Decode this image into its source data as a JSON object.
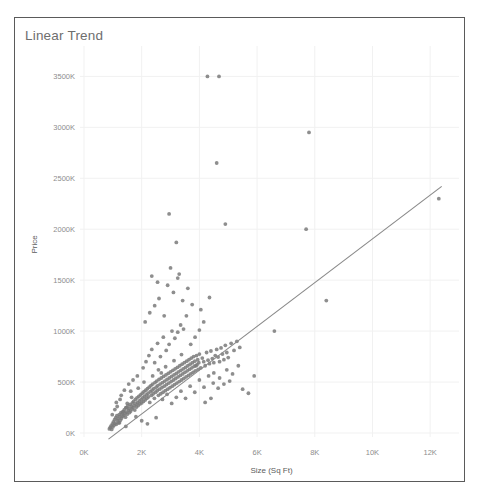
{
  "chart_title": "Linear Trend",
  "chart_data": {
    "type": "scatter",
    "title": "Linear Trend",
    "xlabel": "Size (Sq Ft)",
    "ylabel": "Price",
    "grid": true,
    "legend": false,
    "xlim": [
      0,
      13000
    ],
    "ylim": [
      0,
      3700000
    ],
    "x_ticks": [
      0,
      2000,
      4000,
      6000,
      8000,
      10000,
      12000
    ],
    "x_tick_labels": [
      "0K",
      "2K",
      "4K",
      "6K",
      "8K",
      "10K",
      "12K"
    ],
    "y_ticks": [
      0,
      500000,
      1000000,
      1500000,
      2000000,
      2500000,
      3000000,
      3500000
    ],
    "y_tick_labels": [
      "0K",
      "500K",
      "1000K",
      "1500K",
      "2000K",
      "2500K",
      "3000K",
      "3500K"
    ],
    "point_color": "#7a7a7a",
    "trend_color": "#888888",
    "trendline": {
      "x": [
        850,
        12400
      ],
      "y": [
        -60000,
        2420000
      ]
    },
    "series": [
      {
        "name": "Price vs Size",
        "points": [
          [
            880,
            40000
          ],
          [
            910,
            55000
          ],
          [
            940,
            70000
          ],
          [
            960,
            35000
          ],
          [
            985,
            90000
          ],
          [
            1000,
            60000
          ],
          [
            1020,
            110000
          ],
          [
            1040,
            75000
          ],
          [
            1060,
            130000
          ],
          [
            1080,
            95000
          ],
          [
            1100,
            150000
          ],
          [
            1120,
            85000
          ],
          [
            1140,
            170000
          ],
          [
            1160,
            120000
          ],
          [
            1180,
            140000
          ],
          [
            1200,
            100000
          ],
          [
            1220,
            180000
          ],
          [
            1240,
            160000
          ],
          [
            1260,
            125000
          ],
          [
            1280,
            200000
          ],
          [
            1300,
            145000
          ],
          [
            1320,
            190000
          ],
          [
            1340,
            165000
          ],
          [
            1360,
            210000
          ],
          [
            1380,
            175000
          ],
          [
            1400,
            230000
          ],
          [
            1420,
            195000
          ],
          [
            1440,
            155000
          ],
          [
            1460,
            250000
          ],
          [
            1480,
            205000
          ],
          [
            1500,
            185000
          ],
          [
            1520,
            265000
          ],
          [
            1540,
            225000
          ],
          [
            1560,
            240000
          ],
          [
            1580,
            200000
          ],
          [
            1600,
            280000
          ],
          [
            1620,
            215000
          ],
          [
            1640,
            260000
          ],
          [
            1660,
            235000
          ],
          [
            1680,
            295000
          ],
          [
            1700,
            250000
          ],
          [
            1720,
            310000
          ],
          [
            1740,
            270000
          ],
          [
            1760,
            225000
          ],
          [
            1780,
            330000
          ],
          [
            1800,
            285000
          ],
          [
            1820,
            255000
          ],
          [
            1840,
            345000
          ],
          [
            1860,
            300000
          ],
          [
            1880,
            270000
          ],
          [
            1900,
            360000
          ],
          [
            1920,
            315000
          ],
          [
            1940,
            285000
          ],
          [
            1960,
            375000
          ],
          [
            1980,
            330000
          ],
          [
            2000,
            295000
          ],
          [
            2020,
            390000
          ],
          [
            2040,
            345000
          ],
          [
            2060,
            310000
          ],
          [
            2080,
            405000
          ],
          [
            2100,
            360000
          ],
          [
            2120,
            325000
          ],
          [
            2140,
            420000
          ],
          [
            2160,
            375000
          ],
          [
            2180,
            340000
          ],
          [
            2200,
            435000
          ],
          [
            2220,
            390000
          ],
          [
            2240,
            355000
          ],
          [
            2260,
            450000
          ],
          [
            2280,
            300000
          ],
          [
            2300,
            405000
          ],
          [
            2320,
            465000
          ],
          [
            2340,
            370000
          ],
          [
            2360,
            420000
          ],
          [
            2380,
            480000
          ],
          [
            2400,
            385000
          ],
          [
            2420,
            435000
          ],
          [
            2440,
            340000
          ],
          [
            2460,
            495000
          ],
          [
            2480,
            400000
          ],
          [
            2500,
            450000
          ],
          [
            2520,
            510000
          ],
          [
            2540,
            415000
          ],
          [
            2560,
            465000
          ],
          [
            2580,
            370000
          ],
          [
            2600,
            525000
          ],
          [
            2620,
            430000
          ],
          [
            2640,
            480000
          ],
          [
            2660,
            385000
          ],
          [
            2680,
            540000
          ],
          [
            2700,
            445000
          ],
          [
            2720,
            495000
          ],
          [
            2740,
            400000
          ],
          [
            2760,
            555000
          ],
          [
            2780,
            460000
          ],
          [
            2800,
            510000
          ],
          [
            2820,
            415000
          ],
          [
            2840,
            570000
          ],
          [
            2860,
            475000
          ],
          [
            2880,
            525000
          ],
          [
            2900,
            430000
          ],
          [
            2920,
            585000
          ],
          [
            2940,
            490000
          ],
          [
            2960,
            540000
          ],
          [
            2980,
            445000
          ],
          [
            3000,
            600000
          ],
          [
            3020,
            505000
          ],
          [
            3040,
            555000
          ],
          [
            3060,
            460000
          ],
          [
            3080,
            615000
          ],
          [
            3100,
            520000
          ],
          [
            3120,
            570000
          ],
          [
            3140,
            475000
          ],
          [
            3160,
            630000
          ],
          [
            3180,
            535000
          ],
          [
            3200,
            585000
          ],
          [
            3220,
            490000
          ],
          [
            3240,
            645000
          ],
          [
            3260,
            550000
          ],
          [
            3280,
            600000
          ],
          [
            3300,
            505000
          ],
          [
            3320,
            660000
          ],
          [
            3340,
            565000
          ],
          [
            3360,
            615000
          ],
          [
            3380,
            520000
          ],
          [
            3400,
            675000
          ],
          [
            3420,
            580000
          ],
          [
            3440,
            630000
          ],
          [
            3460,
            535000
          ],
          [
            3480,
            690000
          ],
          [
            3500,
            595000
          ],
          [
            3520,
            645000
          ],
          [
            3540,
            550000
          ],
          [
            3560,
            705000
          ],
          [
            3580,
            610000
          ],
          [
            3600,
            660000
          ],
          [
            3620,
            565000
          ],
          [
            3640,
            720000
          ],
          [
            3660,
            625000
          ],
          [
            3680,
            675000
          ],
          [
            3700,
            580000
          ],
          [
            3720,
            735000
          ],
          [
            3740,
            640000
          ],
          [
            3760,
            690000
          ],
          [
            3780,
            595000
          ],
          [
            3800,
            750000
          ],
          [
            3820,
            655000
          ],
          [
            3840,
            705000
          ],
          [
            3860,
            610000
          ],
          [
            3880,
            660000
          ],
          [
            3900,
            760000
          ],
          [
            3920,
            670000
          ],
          [
            3940,
            720000
          ],
          [
            3960,
            625000
          ],
          [
            3980,
            690000
          ],
          [
            4000,
            775000
          ],
          [
            4050,
            640000
          ],
          [
            4100,
            735000
          ],
          [
            4150,
            700000
          ],
          [
            4200,
            660000
          ],
          [
            4250,
            790000
          ],
          [
            4300,
            715000
          ],
          [
            4350,
            680000
          ],
          [
            4400,
            805000
          ],
          [
            4450,
            730000
          ],
          [
            4500,
            690000
          ],
          [
            4550,
            760000
          ],
          [
            4600,
            820000
          ],
          [
            4650,
            745000
          ],
          [
            4700,
            700000
          ],
          [
            4750,
            835000
          ],
          [
            4800,
            775000
          ],
          [
            4850,
            720000
          ],
          [
            4900,
            860000
          ],
          [
            4950,
            790000
          ],
          [
            5000,
            740000
          ],
          [
            5100,
            880000
          ],
          [
            5200,
            810000
          ],
          [
            5300,
            900000
          ],
          [
            5400,
            840000
          ],
          [
            1250,
            330000
          ],
          [
            1400,
            420000
          ],
          [
            1550,
            480000
          ],
          [
            1700,
            520000
          ],
          [
            1850,
            560000
          ],
          [
            2050,
            640000
          ],
          [
            2150,
            700000
          ],
          [
            2250,
            760000
          ],
          [
            2350,
            820000
          ],
          [
            2450,
            690000
          ],
          [
            2550,
            880000
          ],
          [
            2650,
            750000
          ],
          [
            2750,
            940000
          ],
          [
            2850,
            810000
          ],
          [
            2950,
            870000
          ],
          [
            3050,
            1000000
          ],
          [
            3150,
            930000
          ],
          [
            3250,
            990000
          ],
          [
            3350,
            1060000
          ],
          [
            3450,
            1020000
          ],
          [
            2120,
            1090000
          ],
          [
            2280,
            1180000
          ],
          [
            2450,
            1250000
          ],
          [
            2600,
            1320000
          ],
          [
            2780,
            1150000
          ],
          [
            2900,
            1450000
          ],
          [
            3100,
            1380000
          ],
          [
            3250,
            1520000
          ],
          [
            3420,
            1300000
          ],
          [
            3600,
            1420000
          ],
          [
            2350,
            1540000
          ],
          [
            2550,
            1480000
          ],
          [
            3000,
            1620000
          ],
          [
            3300,
            1560000
          ],
          [
            2950,
            2150000
          ],
          [
            3200,
            1870000
          ],
          [
            4600,
            2650000
          ],
          [
            4900,
            2050000
          ],
          [
            4280,
            3500000
          ],
          [
            4680,
            3500000
          ],
          [
            7800,
            2950000
          ],
          [
            7700,
            2000000
          ],
          [
            8400,
            1300000
          ],
          [
            12300,
            2300000
          ],
          [
            6600,
            1000000
          ],
          [
            5900,
            560000
          ],
          [
            5500,
            430000
          ],
          [
            5700,
            390000
          ],
          [
            4400,
            340000
          ],
          [
            4200,
            300000
          ],
          [
            1150,
            260000
          ],
          [
            1350,
            210000
          ],
          [
            1500,
            290000
          ],
          [
            1650,
            350000
          ],
          [
            1800,
            160000
          ],
          [
            2000,
            120000
          ],
          [
            2200,
            90000
          ],
          [
            2500,
            150000
          ],
          [
            980,
            180000
          ],
          [
            1070,
            230000
          ],
          [
            1230,
            100000
          ],
          [
            1450,
            65000
          ],
          [
            3700,
            870000
          ],
          [
            3850,
            940000
          ],
          [
            4000,
            1010000
          ],
          [
            4150,
            1090000
          ],
          [
            3550,
            1150000
          ],
          [
            3750,
            1260000
          ],
          [
            4050,
            1210000
          ],
          [
            4350,
            1330000
          ],
          [
            2680,
            590000
          ],
          [
            2830,
            650000
          ],
          [
            3120,
            710000
          ],
          [
            3380,
            770000
          ],
          [
            1880,
            440000
          ],
          [
            2080,
            500000
          ],
          [
            2380,
            560000
          ],
          [
            2580,
            620000
          ],
          [
            4500,
            590000
          ],
          [
            4700,
            540000
          ],
          [
            4950,
            620000
          ],
          [
            5150,
            580000
          ],
          [
            5350,
            660000
          ],
          [
            4850,
            480000
          ],
          [
            5050,
            510000
          ],
          [
            4650,
            440000
          ],
          [
            1120,
            300000
          ],
          [
            1290,
            370000
          ],
          [
            1460,
            250000
          ],
          [
            1620,
            410000
          ],
          [
            2720,
            330000
          ],
          [
            2880,
            380000
          ],
          [
            3040,
            290000
          ],
          [
            3200,
            350000
          ],
          [
            3360,
            410000
          ],
          [
            3520,
            340000
          ],
          [
            3680,
            460000
          ],
          [
            3840,
            400000
          ],
          [
            4000,
            520000
          ],
          [
            4160,
            450000
          ],
          [
            4320,
            560000
          ],
          [
            4480,
            490000
          ]
        ]
      }
    ]
  },
  "axis_titles": {
    "x": "Size (Sq Ft)",
    "y": "Price"
  }
}
